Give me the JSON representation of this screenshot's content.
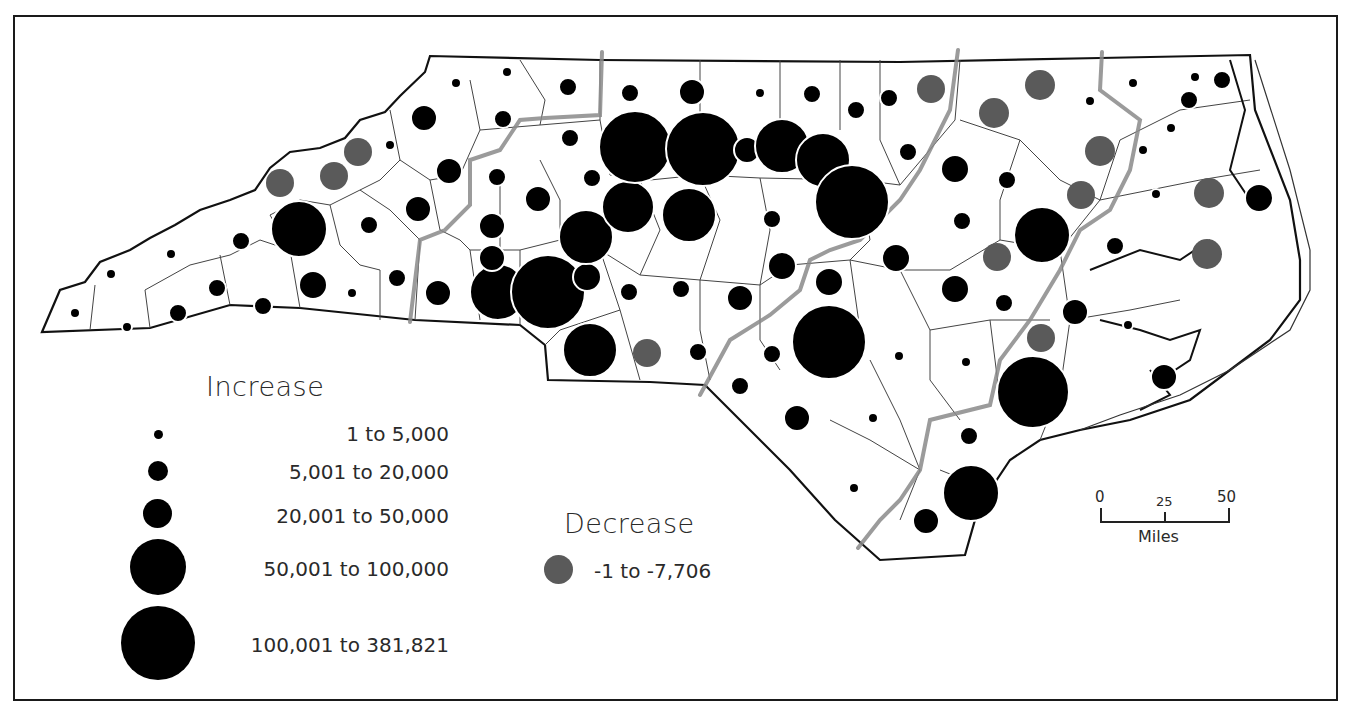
{
  "map": {
    "region": "North Carolina",
    "colors": {
      "increase": "#000000",
      "decrease": "#5a5a5a",
      "region_boundary": "#8a8a8a",
      "county_line": "#333333",
      "state_outline": "#111111"
    }
  },
  "legend": {
    "increase": {
      "title": "Increase",
      "classes": [
        {
          "label": "1 to 5,000",
          "size": "tiny"
        },
        {
          "label": "5,001 to 20,000",
          "size": "small"
        },
        {
          "label": "20,001 to 50,000",
          "size": "medium"
        },
        {
          "label": "50,001 to 100,000",
          "size": "large"
        },
        {
          "label": "100,001 to 381,821",
          "size": "xlarge"
        }
      ]
    },
    "decrease": {
      "title": "Decrease",
      "classes": [
        {
          "label": "-1 to -7,706"
        }
      ]
    }
  },
  "scale_bar": {
    "ticks": [
      "0",
      "25",
      "50"
    ],
    "unit": "Miles"
  }
}
